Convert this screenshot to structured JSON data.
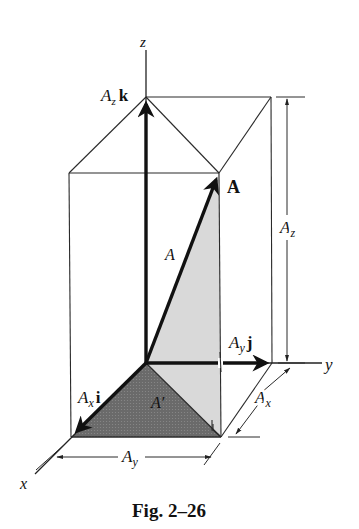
{
  "figure": {
    "caption": "Fig. 2–26",
    "colors": {
      "light_face": "#d8d8d8",
      "dark_face": "#6e6e6e",
      "line": "#1a1a1a"
    },
    "axes": {
      "x": "x",
      "y": "y",
      "z": "z"
    },
    "vectors": {
      "A_bold": "A",
      "A_magnitude": "A",
      "A_prime": "A′",
      "Ax_i": {
        "base": "A",
        "sub": "x",
        "unit": "i"
      },
      "Ay_j": {
        "base": "A",
        "sub": "y",
        "unit": "j"
      },
      "Az_k": {
        "base": "A",
        "sub": "z",
        "unit": "k"
      }
    },
    "dimensions": {
      "Az": {
        "base": "A",
        "sub": "z"
      },
      "Ax": {
        "base": "A",
        "sub": "x"
      },
      "Ay": {
        "base": "A",
        "sub": "y"
      }
    }
  }
}
